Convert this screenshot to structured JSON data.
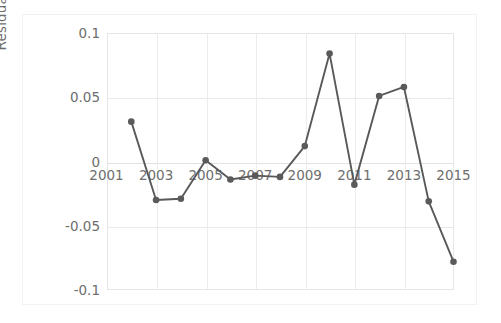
{
  "chart_data": {
    "type": "line",
    "title": "",
    "xlabel": "",
    "ylabel": "Residuals (logits)",
    "x": [
      2002,
      2003,
      2004,
      2005,
      2006,
      2007,
      2008,
      2009,
      2010,
      2011,
      2012,
      2013,
      2014,
      2015
    ],
    "values": [
      0.031,
      -0.03,
      -0.029,
      0.001,
      -0.014,
      -0.011,
      -0.012,
      0.012,
      0.084,
      -0.018,
      0.051,
      0.058,
      -0.031,
      -0.078
    ],
    "series": [
      {
        "name": "Residuals",
        "values": [
          0.031,
          -0.03,
          -0.029,
          0.001,
          -0.014,
          -0.011,
          -0.012,
          0.012,
          0.084,
          -0.018,
          0.051,
          0.058,
          -0.031,
          -0.078
        ]
      }
    ],
    "xlim": [
      2001,
      2015
    ],
    "ylim": [
      -0.1,
      0.1
    ],
    "xticks": [
      2001,
      2003,
      2005,
      2007,
      2009,
      2011,
      2013,
      2015
    ],
    "xtick_labels": [
      "2001",
      "2003",
      "2005",
      "2007",
      "2009",
      "2011",
      "2013",
      "2015"
    ],
    "yticks": [
      0.1,
      0.05,
      0,
      -0.05,
      -0.1
    ],
    "ytick_labels": [
      "0.1",
      "0.05",
      "0",
      "-0.05",
      "-0.1"
    ],
    "grid": true,
    "legend": "none",
    "marker": "circle",
    "line_color": "#595959",
    "marker_color": "#5a5a5a",
    "grid_color": "#e9e9e9",
    "axis_text_color": "#6e6e6e",
    "background_color": "#ffffff"
  },
  "axis": {
    "y_title": "Residuals (logits)",
    "y_labels": [
      "0.1",
      "0.05",
      "0",
      "-0.05",
      "-0.1"
    ],
    "x_labels": [
      "2001",
      "2003",
      "2005",
      "2007",
      "2009",
      "2011",
      "2013",
      "2015"
    ]
  }
}
